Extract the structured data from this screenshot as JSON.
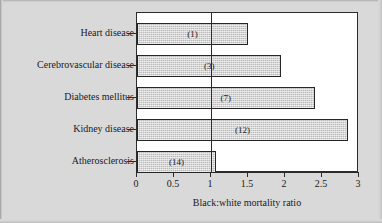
{
  "chart_data": {
    "type": "bar",
    "orientation": "horizontal",
    "title": "",
    "xlabel": "Black:white mortality ratio",
    "ylabel": "",
    "categories": [
      "Heart disease",
      "Cerebrovascular disease",
      "Diabetes mellitus",
      "Kidney disease",
      "Atherosclerosis"
    ],
    "values": [
      1.5,
      1.95,
      2.4,
      2.85,
      1.07
    ],
    "point_labels": [
      "(1)",
      "(3)",
      "(7)",
      "(12)",
      "(14)"
    ],
    "xlim": [
      0,
      3
    ],
    "ticks": [
      "0",
      "0.5",
      "1",
      "1.5",
      "2",
      "2.5",
      "3"
    ],
    "tick_values": [
      0,
      0.5,
      1,
      1.5,
      2,
      2.5,
      3
    ],
    "reference_line": 1,
    "grid": false,
    "legend": "none",
    "bar_fill": "#bcbcbc",
    "bar_edge": "#262626",
    "plot_background": "#ffffff",
    "page_background": "#d9d9d9"
  }
}
